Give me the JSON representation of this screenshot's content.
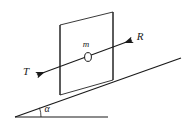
{
  "figure": {
    "type": "physics-diagram",
    "background_color": "#ffffff",
    "line_color": "#1a1a1a",
    "labels": {
      "mass": "m",
      "tension": "T",
      "reaction": "R",
      "angle": "α"
    },
    "elements": {
      "incline_label": "inclined surface",
      "ground_label": "horizontal ground",
      "panel_label": "vertical rectangular panel",
      "mass_label": "point mass marker"
    },
    "geometry": {
      "ground_start_x": 15,
      "ground_start_y": 117,
      "ground_end_x": 108,
      "ground_end_y": 117,
      "incline_start_x": 15,
      "incline_start_y": 117,
      "incline_end_x": 181,
      "incline_end_y": 58,
      "angle_arc_radius": 26,
      "panel_top_left_x": 60,
      "panel_top_left_y": 25,
      "panel_top_right_x": 113,
      "panel_top_right_y": 12,
      "panel_bottom_right_x": 113,
      "panel_bottom_right_y": 80,
      "panel_bottom_left_x": 60,
      "panel_bottom_left_y": 95,
      "mass_cx": 88,
      "mass_cy": 57,
      "mass_rx": 3.4,
      "mass_ry": 4.4,
      "force_line_start_x": 37,
      "force_line_start_y": 75,
      "force_line_end_x": 132,
      "force_line_end_y": 40,
      "tension_label_x": 26,
      "tension_label_y": 72,
      "reaction_label_x": 140,
      "reaction_label_y": 37,
      "angle_label_x": 47,
      "angle_label_y": 110
    }
  }
}
